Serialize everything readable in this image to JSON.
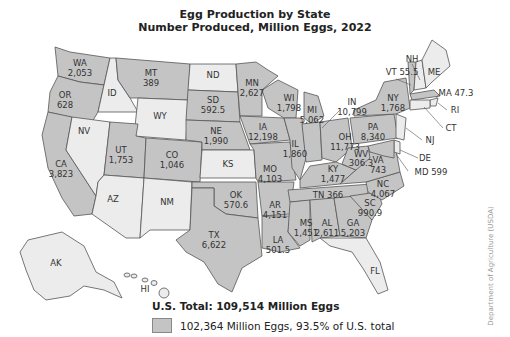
{
  "title": "Egg Production by State",
  "subtitle": "Number Produced, Million Eggs, 2022",
  "total_label": "U.S. Total: 109,514 Million Eggs",
  "legend": {
    "swatch_color": "#c4c4c4",
    "label": "102,364 Million Eggs, 93.5% of U.S. total"
  },
  "credit": "Department of Agriculture (USDA)",
  "colors": {
    "shaded": "#c4c4c4",
    "unshaded": "#ececec",
    "border": "#555555"
  },
  "states": [
    {
      "abbr": "WA",
      "value": "2,053",
      "shaded": true
    },
    {
      "abbr": "OR",
      "value": "628",
      "shaded": true
    },
    {
      "abbr": "CA",
      "value": "3,823",
      "shaded": true
    },
    {
      "abbr": "ID",
      "value": "",
      "shaded": false
    },
    {
      "abbr": "NV",
      "value": "",
      "shaded": false
    },
    {
      "abbr": "MT",
      "value": "389",
      "shaded": true
    },
    {
      "abbr": "WY",
      "value": "",
      "shaded": false
    },
    {
      "abbr": "UT",
      "value": "1,753",
      "shaded": true
    },
    {
      "abbr": "AZ",
      "value": "",
      "shaded": false
    },
    {
      "abbr": "CO",
      "value": "1,046",
      "shaded": true
    },
    {
      "abbr": "NM",
      "value": "",
      "shaded": false
    },
    {
      "abbr": "ND",
      "value": "",
      "shaded": false
    },
    {
      "abbr": "SD",
      "value": "592.5",
      "shaded": true
    },
    {
      "abbr": "NE",
      "value": "1,990",
      "shaded": true
    },
    {
      "abbr": "KS",
      "value": "",
      "shaded": false
    },
    {
      "abbr": "OK",
      "value": "570.6",
      "shaded": true
    },
    {
      "abbr": "TX",
      "value": "6,622",
      "shaded": true
    },
    {
      "abbr": "MN",
      "value": "2,627",
      "shaded": true
    },
    {
      "abbr": "IA",
      "value": "12,198",
      "shaded": true
    },
    {
      "abbr": "MO",
      "value": "4,103",
      "shaded": true
    },
    {
      "abbr": "AR",
      "value": "4,151",
      "shaded": true
    },
    {
      "abbr": "LA",
      "value": "501.5",
      "shaded": true
    },
    {
      "abbr": "WI",
      "value": "1,798",
      "shaded": true
    },
    {
      "abbr": "IL",
      "value": "1,860",
      "shaded": true
    },
    {
      "abbr": "MI",
      "value": "5,062",
      "shaded": true
    },
    {
      "abbr": "IN",
      "value": "10,799",
      "shaded": true
    },
    {
      "abbr": "OH",
      "value": "11,773",
      "shaded": true
    },
    {
      "abbr": "KY",
      "value": "1,477",
      "shaded": true
    },
    {
      "abbr": "TN",
      "value": "366",
      "shaded": true
    },
    {
      "abbr": "MS",
      "value": "1,451",
      "shaded": true
    },
    {
      "abbr": "AL",
      "value": "2,611",
      "shaded": true
    },
    {
      "abbr": "GA",
      "value": "5,203",
      "shaded": true
    },
    {
      "abbr": "FL",
      "value": "",
      "shaded": false
    },
    {
      "abbr": "SC",
      "value": "990.9",
      "shaded": true
    },
    {
      "abbr": "NC",
      "value": "4,067",
      "shaded": true
    },
    {
      "abbr": "VA",
      "value": "743",
      "shaded": true
    },
    {
      "abbr": "WV",
      "value": "306.3",
      "shaded": true
    },
    {
      "abbr": "PA",
      "value": "8,340",
      "shaded": true
    },
    {
      "abbr": "NY",
      "value": "1,768",
      "shaded": true
    },
    {
      "abbr": "VT",
      "value": "55.5",
      "shaded": true
    },
    {
      "abbr": "NH",
      "value": "",
      "shaded": false
    },
    {
      "abbr": "ME",
      "value": "",
      "shaded": false
    },
    {
      "abbr": "MA",
      "value": "47.3",
      "shaded": true
    },
    {
      "abbr": "RI",
      "value": "",
      "shaded": false
    },
    {
      "abbr": "CT",
      "value": "",
      "shaded": false
    },
    {
      "abbr": "NJ",
      "value": "",
      "shaded": false
    },
    {
      "abbr": "DE",
      "value": "",
      "shaded": false
    },
    {
      "abbr": "MD",
      "value": "599",
      "shaded": true
    },
    {
      "abbr": "AK",
      "value": "",
      "shaded": false
    },
    {
      "abbr": "HI",
      "value": "",
      "shaded": false
    }
  ]
}
